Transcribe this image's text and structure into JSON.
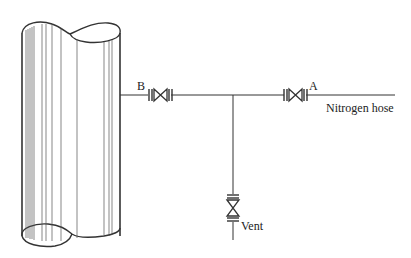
{
  "diagram": {
    "type": "piping-schematic",
    "colors": {
      "line": "#333333",
      "text": "#222222",
      "background": "#ffffff"
    },
    "components": {
      "vessel": {
        "label": "",
        "shape": "cylinder-with-broken-ends"
      },
      "valve_b": {
        "label": "B"
      },
      "valve_a": {
        "label": "A"
      },
      "vent_valve": {
        "label": ""
      }
    },
    "labels": {
      "valve_b": "B",
      "valve_a": "A",
      "nitrogen_hose": "Nitrogen hose",
      "vent": "Vent"
    }
  }
}
